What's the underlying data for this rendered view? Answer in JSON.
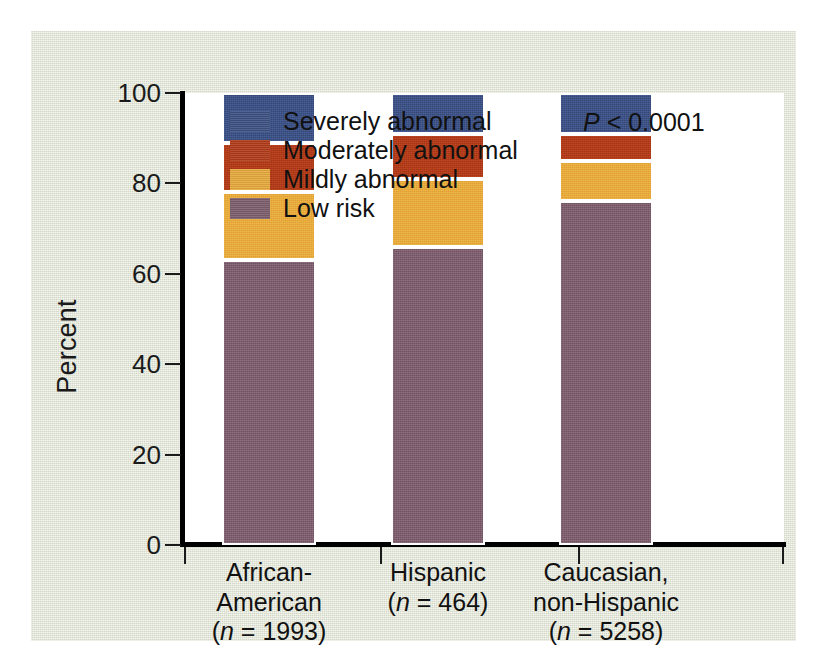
{
  "figure": {
    "panel_background": "#e3e7d6",
    "plot_background": "#ffffff",
    "axis_color": "#000000"
  },
  "annotation": {
    "p_symbol": "P",
    "p_rest": " < 0.0001"
  },
  "legend": {
    "position": "top-left-inside",
    "entries": [
      {
        "label": "Severely abnormal",
        "color": "#3d5182"
      },
      {
        "label": "Moderately abnormal",
        "color": "#b03c1b"
      },
      {
        "label": "Mildly abnormal",
        "color": "#e6a93d"
      },
      {
        "label": "Low risk",
        "color": "#7c5e6d"
      }
    ]
  },
  "axes": {
    "ylabel": "Percent",
    "yticks": [
      "0",
      "20",
      "40",
      "60",
      "80",
      "100"
    ],
    "ylim": [
      0,
      100
    ],
    "xlabel": ""
  },
  "categories": [
    {
      "name": "African-American",
      "line1": "African-",
      "line2": "American",
      "n_prefix": "(",
      "n_italic": "n",
      "n_rest": " = 1993)",
      "n": 1993
    },
    {
      "name": "Hispanic",
      "line1": "Hispanic",
      "line2": "",
      "n_prefix": "(",
      "n_italic": "n",
      "n_rest": " = 464)",
      "n": 464
    },
    {
      "name": "Caucasian, non-Hispanic",
      "line1": "Caucasian,",
      "line2": "non-Hispanic",
      "n_prefix": "(",
      "n_italic": "n",
      "n_rest": " = 5258)",
      "n": 5258
    }
  ],
  "chart_data": {
    "type": "bar",
    "subtype": "stacked-100-percent",
    "title": "",
    "xlabel": "",
    "ylabel": "Percent",
    "ylim": [
      0,
      100
    ],
    "yticks": [
      0,
      20,
      40,
      60,
      80,
      100
    ],
    "grid": false,
    "legend_position": "top-left-inside",
    "annotations": [
      "P < 0.0001"
    ],
    "categories": [
      "African-American (n = 1993)",
      "Hispanic (n = 464)",
      "Caucasian, non-Hispanic (n = 5258)"
    ],
    "series": [
      {
        "name": "Low risk",
        "color": "#7c5e6d",
        "values": [
          63,
          66,
          76
        ]
      },
      {
        "name": "Mildly abnormal",
        "color": "#e6a93d",
        "values": [
          15,
          15,
          9
        ]
      },
      {
        "name": "Moderately abnormal",
        "color": "#b03c1b",
        "values": [
          11,
          10,
          6
        ]
      },
      {
        "name": "Severely abnormal",
        "color": "#3d5182",
        "values": [
          11,
          9,
          9
        ]
      }
    ]
  }
}
